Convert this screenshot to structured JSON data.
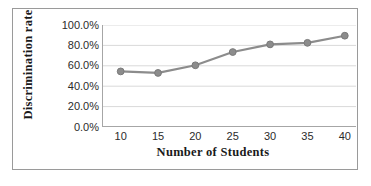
{
  "chart_data": {
    "type": "line",
    "title": "",
    "xlabel": "Number of Students",
    "ylabel": "Discrimination  rate",
    "x": [
      10,
      15,
      20,
      25,
      30,
      35,
      40
    ],
    "values": [
      0.545,
      0.53,
      0.605,
      0.735,
      0.81,
      0.825,
      0.895
    ],
    "xticklabels": [
      "10",
      "15",
      "20",
      "25",
      "30",
      "35",
      "40"
    ],
    "yticklabels": [
      "0.0%",
      "20.0%",
      "40.0%",
      "60.0%",
      "80.0%",
      "100.0%"
    ],
    "ytickvalues": [
      0.0,
      0.2,
      0.4,
      0.6,
      0.8,
      1.0
    ],
    "xlim": [
      7.5,
      41.5
    ],
    "ylim": [
      0.0,
      1.0
    ],
    "grid": "horizontal",
    "legend": "none",
    "series_color": "#8c8c8c",
    "marker": "circle",
    "marker_color": "#8c8c8c",
    "gridline_color": "#d9d9d9",
    "axis_color": "#a6a6a6",
    "border_color": "#9a9a9a",
    "background": "#ffffff",
    "text_color": "#1a1a1a"
  }
}
